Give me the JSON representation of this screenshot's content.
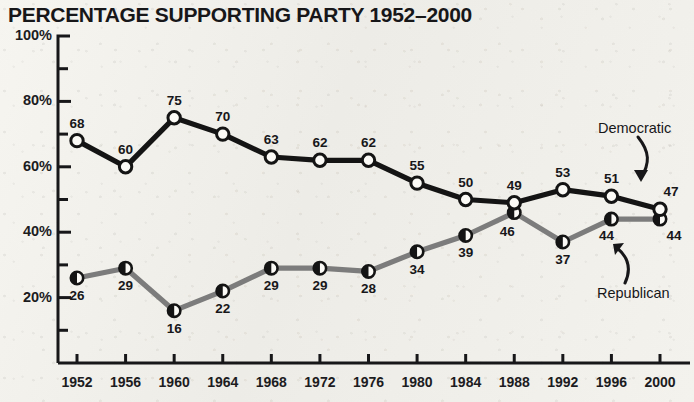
{
  "chart_data": {
    "type": "line",
    "title": "PERCENTAGE SUPPORTING PARTY 1952–2000",
    "xlabel": "",
    "ylabel": "",
    "categories": [
      "1952",
      "1956",
      "1960",
      "1964",
      "1968",
      "1972",
      "1976",
      "1980",
      "1984",
      "1988",
      "1992",
      "1996",
      "2000"
    ],
    "ylim": [
      0,
      100
    ],
    "yticks": [
      20,
      40,
      60,
      80,
      100
    ],
    "ytick_labels": [
      "20%",
      "40%",
      "60%",
      "80%",
      "100%"
    ],
    "yminor_step": 10,
    "grid": false,
    "legend": "annotations",
    "series": [
      {
        "name": "Democratic",
        "color": "#141414",
        "marker": "open-circle",
        "values": [
          68,
          60,
          75,
          70,
          63,
          62,
          62,
          55,
          50,
          49,
          53,
          51,
          47
        ],
        "label_offsets": [
          "above",
          "below",
          "above",
          "above",
          "above",
          "above",
          "above",
          "above",
          "above",
          "above",
          "above",
          "above",
          "above"
        ]
      },
      {
        "name": "Republican",
        "color": "#7c7c7c",
        "marker": "half-filled-circle",
        "values": [
          26,
          29,
          16,
          22,
          29,
          29,
          28,
          34,
          39,
          46,
          37,
          44,
          44
        ],
        "label_offsets": [
          "below",
          "below",
          "below",
          "below",
          "below",
          "below",
          "below",
          "below",
          "below",
          "below",
          "below",
          "below",
          "below"
        ]
      }
    ],
    "annotations": [
      {
        "text": "Democratic",
        "target_series": "Democratic",
        "target_year": "2000"
      },
      {
        "text": "Republican",
        "target_series": "Republican",
        "target_year": "2000"
      }
    ]
  },
  "colors": {
    "background": "#f2f1ec",
    "ink": "#17171a",
    "democratic": "#141414",
    "republican": "#7c7c7c"
  }
}
